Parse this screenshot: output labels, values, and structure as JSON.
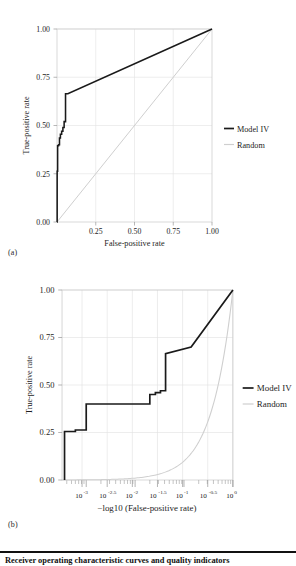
{
  "figure": {
    "background": "#ffffff",
    "panels": [
      {
        "key": "a",
        "label": "(a)"
      },
      {
        "key": "b",
        "label": "(b)"
      }
    ],
    "caption": "Receiver operating characteristic curves and quality indicators"
  },
  "colors": {
    "model": "#1a1a1a",
    "random": "#cfcfcf",
    "grid": "#e2e2e2",
    "frame": "#c9c9c9",
    "text": "#1d1d1d"
  },
  "chart_data": [
    {
      "type": "line",
      "panel": "(a)",
      "title": "",
      "xlabel": "False-positive rate",
      "ylabel": "True-positive rate",
      "xlim": [
        0,
        1
      ],
      "ylim": [
        0,
        1
      ],
      "xticks": [
        0.25,
        0.5,
        0.75,
        1.0
      ],
      "xticklabels": [
        "0.25",
        "0.50",
        "0.75",
        "1.00"
      ],
      "yticks": [
        0.0,
        0.25,
        0.5,
        0.75,
        1.0
      ],
      "yticklabels": [
        "0.00",
        "0.25",
        "0.50",
        "0.75",
        "1.00"
      ],
      "grid": true,
      "legend_position": "right",
      "series": [
        {
          "name": "Model IV",
          "color": "#1a1a1a",
          "x": [
            0.0,
            0.001,
            0.001,
            0.004,
            0.004,
            0.01,
            0.01,
            0.016,
            0.016,
            0.022,
            0.022,
            0.03,
            0.03,
            0.038,
            0.038,
            0.046,
            0.046,
            0.055,
            0.055,
            0.07,
            1.0
          ],
          "y": [
            0.0,
            0.0,
            0.263,
            0.263,
            0.395,
            0.395,
            0.4,
            0.4,
            0.435,
            0.435,
            0.455,
            0.455,
            0.47,
            0.47,
            0.49,
            0.49,
            0.52,
            0.52,
            0.665,
            0.665,
            1.0
          ]
        },
        {
          "name": "Random",
          "color": "#cfcfcf",
          "x": [
            0.0,
            1.0
          ],
          "y": [
            0.0,
            1.0
          ]
        }
      ]
    },
    {
      "type": "line",
      "panel": "(b)",
      "title": "",
      "xlabel": "−log10 (False-positive rate)",
      "ylabel": "True-positive rate",
      "xscale": "log",
      "xlim": [
        0.00032,
        1.0
      ],
      "ylim": [
        0,
        1
      ],
      "xticks": [
        0.001,
        0.00316,
        0.01,
        0.0316,
        0.1,
        0.316,
        1.0
      ],
      "xticklabels": [
        "10−3",
        "10−2.5",
        "10−2",
        "10−1.5",
        "10−1",
        "10−0.5",
        "10⁰"
      ],
      "xtick_bases": [
        "10",
        "10",
        "10",
        "10",
        "10",
        "10",
        "10"
      ],
      "xtick_exponents": [
        "-3",
        "-2.5",
        "-2",
        "-1.5",
        "-1",
        "-0.5",
        "0"
      ],
      "yticks": [
        0.0,
        0.25,
        0.5,
        0.75,
        1.0
      ],
      "yticklabels": [
        "0.00",
        "0.25",
        "0.50",
        "0.75",
        "1.00"
      ],
      "grid": true,
      "legend_position": "right",
      "series": [
        {
          "name": "Model IV",
          "color": "#1a1a1a",
          "x": [
            0.00036,
            0.00036,
            0.0006,
            0.0006,
            0.001,
            0.001,
            0.02,
            0.02,
            0.026,
            0.026,
            0.033,
            0.033,
            0.042,
            0.042,
            0.14,
            1.0
          ],
          "y": [
            0.0,
            0.255,
            0.255,
            0.263,
            0.263,
            0.4,
            0.4,
            0.45,
            0.45,
            0.46,
            0.46,
            0.47,
            0.47,
            0.665,
            0.7,
            1.0
          ]
        },
        {
          "name": "Random",
          "color": "#cfcfcf",
          "x": [
            0.00032,
            0.001,
            0.00316,
            0.01,
            0.0316,
            0.0562,
            0.1,
            0.178,
            0.316,
            0.562,
            0.75,
            1.0
          ],
          "y": [
            0.0003,
            0.001,
            0.0032,
            0.01,
            0.0316,
            0.0562,
            0.1,
            0.178,
            0.316,
            0.562,
            0.75,
            1.0
          ]
        }
      ]
    }
  ],
  "legend": {
    "entries": [
      {
        "label": "Model IV",
        "color": "#1a1a1a",
        "width": "thick"
      },
      {
        "label": "Random",
        "color": "#cfcfcf",
        "width": "thin"
      }
    ]
  }
}
